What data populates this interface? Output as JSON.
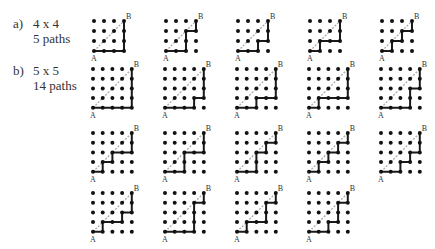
{
  "parts": [
    {
      "letter": "a)",
      "size": "4 x 4",
      "count": "5 paths"
    },
    {
      "letter": "b)",
      "size": "5 x 5",
      "count": "14 paths"
    }
  ],
  "corner_labels": {
    "start": "A",
    "end": "B"
  },
  "colors": {
    "dot": "#111111",
    "path": "#1a1a1a",
    "diagonal": "#aaaaaa"
  },
  "grids": {
    "four": {
      "n": 4,
      "paths": [
        "RRRUUU",
        "RRUURU",
        "RRURUU",
        "RURRUU",
        "RURURU"
      ]
    },
    "five": {
      "n": 5,
      "paths": [
        "RRRRUUUU",
        "RRRURUUU",
        "RRURRUUU",
        "RURRRUUU",
        "RRRUURUU",
        "RURURRUU",
        "RRUURRUU",
        "RRUURURU",
        "RURURURU",
        "RRURURUU",
        "RURRURUU",
        "RRRUUURU",
        "RURRUURU",
        "RRURUURU"
      ]
    }
  }
}
